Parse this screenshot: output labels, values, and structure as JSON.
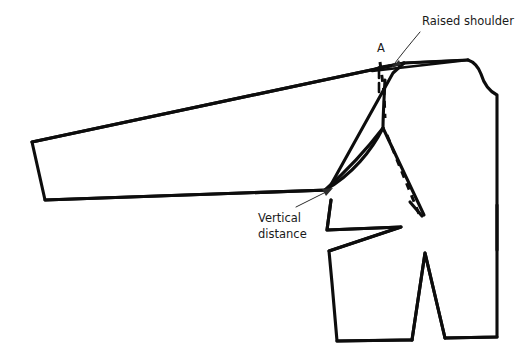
{
  "diagram": {
    "type": "technical-line-drawing",
    "background_color": "#ffffff",
    "line_color": "#0d0d0d",
    "labels": {
      "raised_shoulder": "Raised shoulder",
      "vertical_distance_line1": "Vertical",
      "vertical_distance_line2": "distance",
      "point_a": "A"
    },
    "parts": {
      "sleeve_name": "sleeve-panel",
      "bodice_name": "bodice-panel",
      "armhole_name": "armhole-curve",
      "dart_name": "waist-dart",
      "notch_name": "underarm-notch",
      "dashed_name": "original-shoulder-and-side-seam"
    }
  }
}
